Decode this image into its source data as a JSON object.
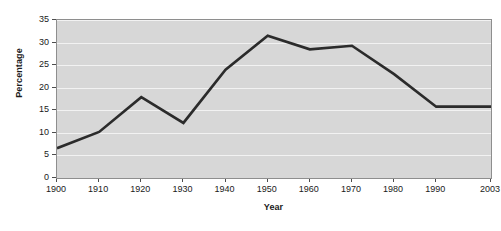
{
  "chart_data": {
    "type": "line",
    "title": "",
    "xlabel": "Year",
    "ylabel": "Percentage",
    "x": [
      1900,
      1910,
      1920,
      1930,
      1940,
      1950,
      1960,
      1970,
      1980,
      1990,
      2003
    ],
    "categories": [
      "1900",
      "1910",
      "1920",
      "1930",
      "1940",
      "1950",
      "1960",
      "1970",
      "1980",
      "1990",
      "2003"
    ],
    "values": [
      6.6,
      10.2,
      17.9,
      12.2,
      24.0,
      31.5,
      28.5,
      29.3,
      23.0,
      15.8,
      15.8
    ],
    "series": [
      {
        "name": "Percentage",
        "values": [
          6.6,
          10.2,
          17.9,
          12.2,
          24.0,
          31.5,
          28.5,
          29.3,
          23.0,
          15.8,
          15.8
        ]
      }
    ],
    "xtick_labels": [
      "1900",
      "1910",
      "1920",
      "1930",
      "1940",
      "1950",
      "1960",
      "1970",
      "1980",
      "1990",
      "2003"
    ],
    "ytick_labels": [
      "0",
      "5",
      "10",
      "15",
      "20",
      "25",
      "30",
      "35"
    ],
    "yticks": [
      0,
      5,
      10,
      15,
      20,
      25,
      30,
      35
    ],
    "ylim": [
      0,
      35
    ],
    "xlim": [
      1900,
      2003
    ],
    "grid": true,
    "grid_axis": "y",
    "legend": false,
    "legend_position": "none",
    "colors": {
      "line": "#2b2b2b",
      "plot_background": "#d7d7d7",
      "gridline": "#f2f2f2",
      "axis": "#8e8e8e",
      "text": "#1a1a1a"
    },
    "line_width": 2.6
  }
}
